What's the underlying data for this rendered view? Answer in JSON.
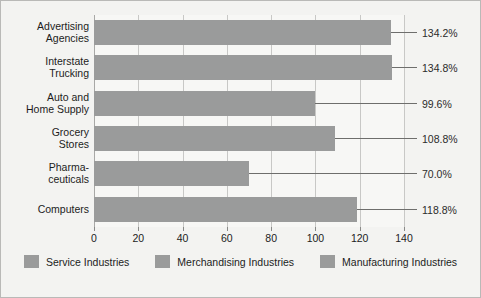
{
  "chart_data": {
    "type": "bar",
    "orientation": "horizontal",
    "title": "",
    "subtitle": "",
    "xlabel": "",
    "ylabel": "",
    "xlim": [
      0,
      140
    ],
    "xticks": [
      0,
      20,
      40,
      60,
      80,
      100,
      120,
      140
    ],
    "xtick_labels": [
      "0",
      "20",
      "40",
      "60",
      "80",
      "100",
      "120",
      "140"
    ],
    "grid": true,
    "grid_axis": "x",
    "legend_position": "bottom",
    "categories": [
      "Advertising\nAgencies",
      "Interstate\nTrucking",
      "Auto and\nHome Supply",
      "Grocery\nStores",
      "Pharma-\nceuticals",
      "Computers"
    ],
    "values": [
      134.2,
      134.8,
      99.6,
      108.8,
      70.0,
      118.8
    ],
    "data_labels": [
      "134.2%",
      "134.8%",
      "99.6%",
      "108.8%",
      "70.0%",
      "118.8%"
    ],
    "legend": [
      "Service Industries",
      "Merchandising Industries",
      "Manufacturing Industries"
    ],
    "series_colors": [
      "#9a9b9b",
      "#9a9b9b",
      "#9a9b9b"
    ],
    "bar_color": "#9a9b9b",
    "plot_background": "#f7f7f5",
    "frame_background": "#f3f3f1",
    "gridline_color": "#c8c8c6",
    "text_color": "#1c1c1c"
  }
}
